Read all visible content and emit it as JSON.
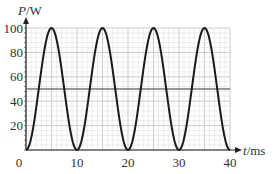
{
  "chart_data": {
    "type": "line",
    "title": "",
    "xlabel": "t/ms",
    "ylabel": "P/W",
    "xlim": [
      0,
      40
    ],
    "ylim": [
      0,
      100
    ],
    "x_ticks": [
      0,
      10,
      20,
      30,
      40
    ],
    "y_ticks": [
      20,
      40,
      60,
      80,
      100
    ],
    "x_tick_labels": [
      "0",
      "10",
      "20",
      "30",
      "40"
    ],
    "y_tick_labels": [
      "20",
      "40",
      "60",
      "80",
      "100"
    ],
    "grid": true,
    "legend": null,
    "series": [
      {
        "name": "instantaneous power",
        "description": "P = 50 - 50 cos(2*pi*t/10), sinusoid between 0 and 100 W with period 10 ms",
        "x": [
          0,
          2.5,
          5,
          7.5,
          10,
          12.5,
          15,
          17.5,
          20,
          22.5,
          25,
          27.5,
          30,
          32.5,
          35,
          37.5,
          40
        ],
        "values": [
          0,
          50,
          100,
          50,
          0,
          50,
          100,
          50,
          0,
          50,
          100,
          50,
          0,
          50,
          100,
          50,
          0
        ],
        "color": "#1a1a1a"
      },
      {
        "name": "mean power",
        "x": [
          0,
          40
        ],
        "values": [
          50,
          50
        ],
        "color": "#777777"
      }
    ]
  }
}
